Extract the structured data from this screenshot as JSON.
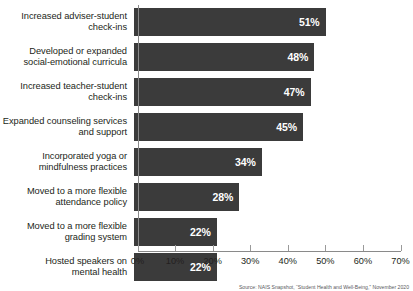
{
  "chart_data": {
    "type": "bar",
    "orientation": "horizontal",
    "title": "",
    "xlabel": "",
    "ylabel": "",
    "xlim": [
      0,
      70
    ],
    "grid": false,
    "legend": null,
    "categories": [
      "Increased adviser-student\ncheck-ins",
      "Developed or expanded\nsocial-emotional curricula",
      "Increased teacher-student\ncheck-ins",
      "Expanded counseling services\nand support",
      "Incorporated yoga or\nmindfulness practices",
      "Moved to a more flexible\nattendance policy",
      "Moved to a more flexible\ngrading system",
      "Hosted speakers on\nmental health"
    ],
    "values": [
      51,
      48,
      47,
      45,
      34,
      28,
      22,
      22
    ],
    "value_labels": [
      "51%",
      "48%",
      "47%",
      "45%",
      "34%",
      "28%",
      "22%",
      "22%"
    ],
    "xticks": [
      0,
      10,
      20,
      30,
      40,
      50,
      60,
      70
    ],
    "xtick_labels": [
      "0%",
      "10%",
      "20%",
      "30%",
      "40%",
      "50%",
      "60%",
      "70%"
    ],
    "bar_color": "#3b3b3b",
    "value_label_color": "#ffffff",
    "background_color": "#ffffff",
    "axis_color": "#8a8a8a"
  },
  "source": {
    "text": "Source: NAIS Snapshot, “Student Health and Well-Being,” November 2020"
  }
}
